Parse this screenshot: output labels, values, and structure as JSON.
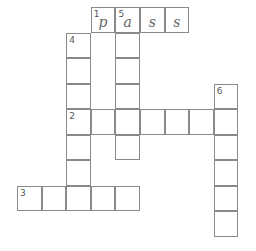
{
  "puzzle": {
    "type": "crossword",
    "cells": [
      {
        "r": 0,
        "c": 3,
        "num": "1",
        "letter": "p"
      },
      {
        "r": 0,
        "c": 4,
        "num": "5",
        "letter": "a"
      },
      {
        "r": 0,
        "c": 5,
        "letter": "s"
      },
      {
        "r": 0,
        "c": 6,
        "letter": "s"
      },
      {
        "r": 1,
        "c": 2,
        "num": "4"
      },
      {
        "r": 2,
        "c": 2
      },
      {
        "r": 3,
        "c": 2
      },
      {
        "r": 4,
        "c": 2,
        "num": "2"
      },
      {
        "r": 5,
        "c": 2
      },
      {
        "r": 6,
        "c": 2
      },
      {
        "r": 7,
        "c": 2
      },
      {
        "r": 1,
        "c": 4
      },
      {
        "r": 2,
        "c": 4
      },
      {
        "r": 3,
        "c": 4
      },
      {
        "r": 4,
        "c": 4
      },
      {
        "r": 5,
        "c": 4
      },
      {
        "r": 4,
        "c": 3
      },
      {
        "r": 4,
        "c": 5
      },
      {
        "r": 4,
        "c": 6
      },
      {
        "r": 4,
        "c": 7
      },
      {
        "r": 3,
        "c": 8,
        "num": "6"
      },
      {
        "r": 4,
        "c": 8
      },
      {
        "r": 5,
        "c": 8
      },
      {
        "r": 6,
        "c": 8
      },
      {
        "r": 7,
        "c": 8
      },
      {
        "r": 8,
        "c": 8
      },
      {
        "r": 7,
        "c": 0,
        "num": "3"
      },
      {
        "r": 7,
        "c": 1
      },
      {
        "r": 7,
        "c": 3
      },
      {
        "r": 7,
        "c": 4
      }
    ],
    "words": [
      {
        "number": "1",
        "direction": "across",
        "answer_shown": "pass"
      },
      {
        "number": "2",
        "direction": "across",
        "answer_shown": ""
      },
      {
        "number": "3",
        "direction": "across",
        "answer_shown": ""
      },
      {
        "number": "4",
        "direction": "down",
        "answer_shown": ""
      },
      {
        "number": "5",
        "direction": "down",
        "answer_shown": "a"
      },
      {
        "number": "6",
        "direction": "down",
        "answer_shown": ""
      }
    ]
  }
}
